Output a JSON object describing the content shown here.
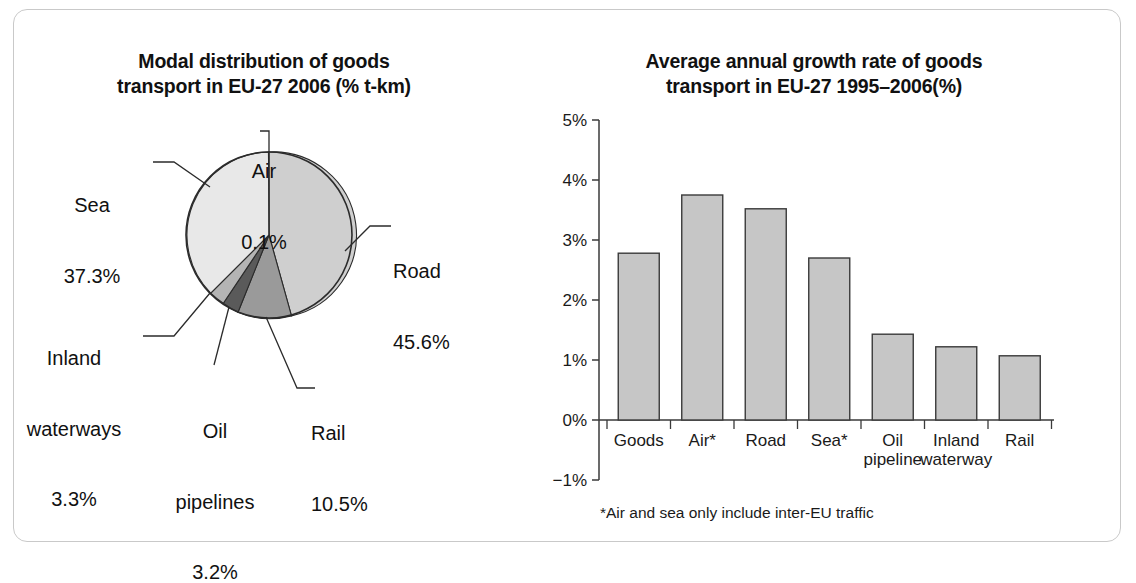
{
  "figure": {
    "background": "#ffffff",
    "frame_color": "#c9c9c9"
  },
  "pie_panel": {
    "title_line1": "Modal distribution of goods",
    "title_line2": "transport in EU-27 2006 (% t-km)",
    "labels": {
      "air_name": "Air",
      "air_value": "0.1%",
      "sea_name": "Sea",
      "sea_value": "37.3%",
      "inland_name_line1": "Inland",
      "inland_name_line2": "waterways",
      "inland_value": "3.3%",
      "oil_name_line1": "Oil",
      "oil_name_line2": "pipelines",
      "oil_value": "3.2%",
      "rail_name": "Rail",
      "rail_value": "10.5%",
      "road_name": "Road",
      "road_value": "45.6%"
    }
  },
  "bar_panel": {
    "title_line1": "Average annual growth rate of goods",
    "title_line2": "transport in EU-27 1995–2006(%)",
    "footnote": "*Air and sea only include inter-EU traffic"
  },
  "chart_data": [
    {
      "type": "pie",
      "title": "Modal distribution of goods transport in EU-27 2006 (% t-km)",
      "unit": "% t-km",
      "start_angle_deg": 0,
      "direction": "clockwise",
      "categories": [
        "Road",
        "Rail",
        "Oil pipelines",
        "Inland waterways",
        "Sea",
        "Air"
      ],
      "values": [
        45.6,
        10.5,
        3.2,
        3.3,
        37.3,
        0.1
      ],
      "labels": [
        "45.6%",
        "10.5%",
        "3.2%",
        "3.3%",
        "37.3%",
        "0.1%"
      ],
      "colors": [
        "#cfcfcf",
        "#9a9a9a",
        "#5a5a5a",
        "#b4b4b4",
        "#e8e8e8",
        "#f2f2f2"
      ],
      "legend": "none",
      "slice_outline": "#2b2b2b"
    },
    {
      "type": "bar",
      "title": "Average annual growth rate of goods transport in EU-27 1995–2006(%)",
      "xlabel": "",
      "ylabel": "",
      "ylim": [
        -1,
        5
      ],
      "yticks": [
        -1,
        0,
        1,
        2,
        3,
        4,
        5
      ],
      "ytick_labels": [
        "−1%",
        "0%",
        "1%",
        "2%",
        "3%",
        "4%",
        "5%"
      ],
      "grid": false,
      "legend": "none",
      "bar_color": "#c6c6c6",
      "bar_edge_color": "#3a3a3a",
      "categories": [
        "Goods",
        "Air*",
        "Road",
        "Sea*",
        "Oil pipeline",
        "Inland waterway",
        "Rail"
      ],
      "category_label_lines": [
        [
          "Goods"
        ],
        [
          "Air*"
        ],
        [
          "Road"
        ],
        [
          "Sea*"
        ],
        [
          "Oil",
          "pipeline"
        ],
        [
          "Inland",
          "waterway"
        ],
        [
          "Rail"
        ]
      ],
      "values": [
        2.78,
        3.75,
        3.52,
        2.7,
        1.43,
        1.22,
        1.07
      ],
      "note": "*Air and sea only include inter-EU traffic"
    }
  ]
}
